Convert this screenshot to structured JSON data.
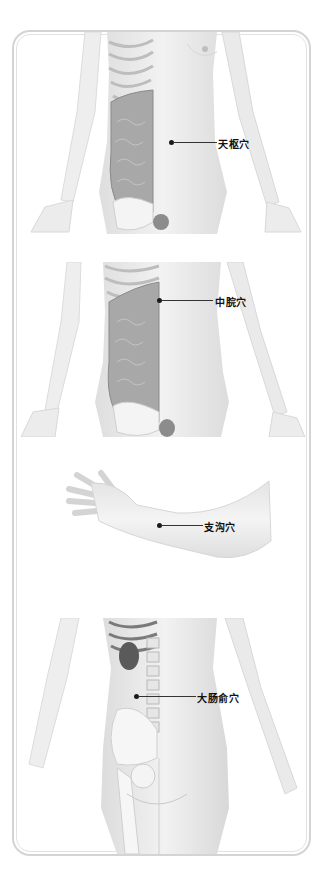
{
  "figure": {
    "panels": [
      {
        "view": "front-torso",
        "acupoint": "天枢穴"
      },
      {
        "view": "front-torso",
        "acupoint": "中脘穴"
      },
      {
        "view": "forearm",
        "acupoint": "支沟穴"
      },
      {
        "view": "back-lower",
        "acupoint": "大肠俞穴"
      }
    ]
  },
  "colors": {
    "frame": "#d4d4d4",
    "skin": "#ececec",
    "organs": "#9a9a9a",
    "marker": "#1a1a1a"
  }
}
